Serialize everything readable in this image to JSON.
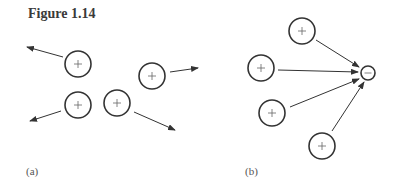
{
  "figure": {
    "title": "Figure 1.14",
    "panels": [
      {
        "label": "(a)",
        "description": "Positive charges repelling each other",
        "charges": [
          {
            "sign": "+",
            "cx": 78,
            "cy": 64,
            "r": 13,
            "arrow": {
              "x1": 63,
              "y1": 57,
              "x2": 27,
              "y2": 47
            }
          },
          {
            "sign": "+",
            "cx": 152,
            "cy": 76,
            "r": 13,
            "arrow": {
              "x1": 170,
              "y1": 72,
              "x2": 198,
              "y2": 68
            }
          },
          {
            "sign": "+",
            "cx": 78,
            "cy": 105,
            "r": 13,
            "arrow": {
              "x1": 61,
              "y1": 111,
              "x2": 30,
              "y2": 121
            }
          },
          {
            "sign": "+",
            "cx": 117,
            "cy": 103,
            "r": 13,
            "arrow": {
              "x1": 134,
              "y1": 112,
              "x2": 175,
              "y2": 130
            }
          }
        ]
      },
      {
        "label": "(b)",
        "description": "Positive charges attracted to a negative charge",
        "target": {
          "sign": "−",
          "cx": 368,
          "cy": 73,
          "r": 7
        },
        "charges": [
          {
            "sign": "+",
            "cx": 302,
            "cy": 31,
            "r": 13,
            "arrow": {
              "x1": 316,
              "y1": 40,
              "x2": 359,
              "y2": 67
            }
          },
          {
            "sign": "+",
            "cx": 261,
            "cy": 68,
            "r": 13,
            "arrow": {
              "x1": 278,
              "y1": 70,
              "x2": 358,
              "y2": 72
            }
          },
          {
            "sign": "+",
            "cx": 272,
            "cy": 113,
            "r": 13,
            "arrow": {
              "x1": 290,
              "y1": 107,
              "x2": 359,
              "y2": 79
            }
          },
          {
            "sign": "+",
            "cx": 322,
            "cy": 146,
            "r": 13,
            "arrow": {
              "x1": 332,
              "y1": 131,
              "x2": 364,
              "y2": 82
            }
          }
        ]
      }
    ]
  }
}
